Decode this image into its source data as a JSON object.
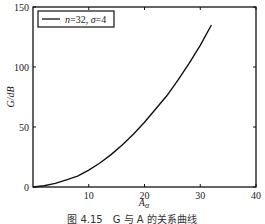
{
  "chart_data": {
    "type": "line",
    "title": "",
    "xlabel": "A_α",
    "xlabel_main": "A",
    "xlabel_sub": "α",
    "ylabel": "G/dB",
    "xlim": [
      0,
      40
    ],
    "ylim": [
      0,
      150
    ],
    "xticks": [
      10,
      20,
      30,
      40
    ],
    "xtick_labels": [
      "10",
      "20",
      "30",
      "40"
    ],
    "yticks": [
      0,
      50,
      100,
      150
    ],
    "ytick_labels": [
      "0",
      "50",
      "100",
      "150"
    ],
    "grid": false,
    "legend_position": "top-left",
    "series": [
      {
        "name": "n=32, σ=4",
        "color": "#111111",
        "x": [
          0,
          2,
          4,
          6,
          8,
          10,
          12,
          14,
          16,
          18,
          20,
          22,
          24,
          26,
          28,
          30,
          32
        ],
        "values": [
          0,
          1,
          3,
          6,
          9,
          14,
          20,
          27,
          35,
          44,
          54,
          65,
          76,
          89,
          103,
          118,
          135
        ]
      }
    ],
    "legend_entries": [
      {
        "label_n": "n",
        "label_eq1": "=32, ",
        "label_sigma": "σ",
        "label_eq2": "=4"
      }
    ],
    "caption": "图 4.15　G 与 A 的关系曲线"
  }
}
